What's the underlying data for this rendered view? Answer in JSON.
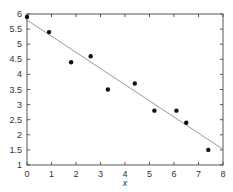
{
  "chart_data": {
    "type": "scatter",
    "title": "",
    "xlabel": "x",
    "ylabel": "",
    "xlim": [
      0,
      8
    ],
    "ylim": [
      1,
      6
    ],
    "xticks": [
      0,
      1,
      2,
      3,
      4,
      5,
      6,
      7,
      8
    ],
    "yticks": [
      1,
      1.5,
      2,
      2.5,
      3,
      3.5,
      4,
      4.5,
      5,
      5.5,
      6
    ],
    "xtick_labels": [
      "0",
      "1",
      "2",
      "3",
      "4",
      "5",
      "6",
      "7",
      "8"
    ],
    "ytick_labels": [
      "1",
      "1.5",
      "2",
      "2.5",
      "3",
      "3.5",
      "4",
      "4.5",
      "5",
      "5.5",
      "6"
    ],
    "grid": false,
    "series": [
      {
        "name": "data",
        "type": "scatter",
        "color": "#111111",
        "points": [
          {
            "x": 0.0,
            "y": 5.9
          },
          {
            "x": 0.9,
            "y": 5.4
          },
          {
            "x": 1.8,
            "y": 4.4
          },
          {
            "x": 2.6,
            "y": 4.6
          },
          {
            "x": 3.3,
            "y": 3.5
          },
          {
            "x": 4.4,
            "y": 3.7
          },
          {
            "x": 5.2,
            "y": 2.8
          },
          {
            "x": 6.1,
            "y": 2.8
          },
          {
            "x": 6.5,
            "y": 2.4
          },
          {
            "x": 7.4,
            "y": 1.5
          }
        ]
      },
      {
        "name": "fit",
        "type": "line",
        "color": "#999999",
        "points": [
          {
            "x": 0,
            "y": 5.8
          },
          {
            "x": 8,
            "y": 1.52
          }
        ]
      }
    ]
  }
}
